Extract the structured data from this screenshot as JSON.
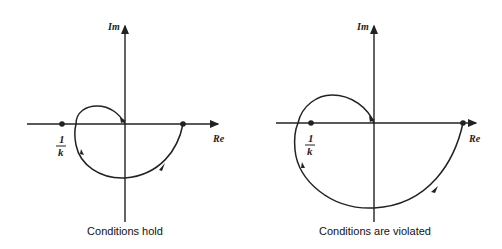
{
  "figure": {
    "panels": [
      {
        "id": "left",
        "caption": "Conditions hold",
        "axis_labels": {
          "imag": "Im",
          "real": "Re"
        },
        "point_label_num": "1",
        "point_label_den": "k"
      },
      {
        "id": "right",
        "caption": "Conditions are violated",
        "axis_labels": {
          "imag": "Im",
          "real": "Re"
        },
        "point_label_num": "1",
        "point_label_den": "k"
      }
    ],
    "colors": {
      "ink": "#222222",
      "background": "#ffffff"
    }
  }
}
